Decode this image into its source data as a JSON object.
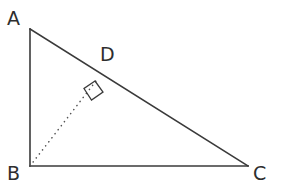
{
  "figure": {
    "kind": "geometry-diagram",
    "background_color": "#ffffff",
    "stroke_color": "#3a3a3a",
    "dotted_color": "#555555",
    "label_color": "#2e2e2e",
    "labels": {
      "a": "A",
      "b": "B",
      "c": "C",
      "d": "D"
    },
    "points": {
      "A": {
        "x": 30,
        "y": 29
      },
      "B": {
        "x": 30,
        "y": 166
      },
      "C": {
        "x": 248,
        "y": 166
      },
      "D": {
        "x": 96,
        "y": 81
      }
    },
    "segments": [
      {
        "name": "AB",
        "from": "A",
        "to": "B",
        "style": "solid",
        "width": 1.6
      },
      {
        "name": "BC",
        "from": "B",
        "to": "C",
        "style": "solid",
        "width": 1.6
      },
      {
        "name": "AC",
        "from": "A",
        "to": "C",
        "style": "solid",
        "width": 1.6
      },
      {
        "name": "BD",
        "from": "B",
        "to": "D",
        "style": "dotted",
        "width": 1.6
      }
    ],
    "right_angle_marker": {
      "at": "D",
      "points": "95,81 84,88.5 91.5,100 103,92",
      "width": 1.3
    }
  }
}
